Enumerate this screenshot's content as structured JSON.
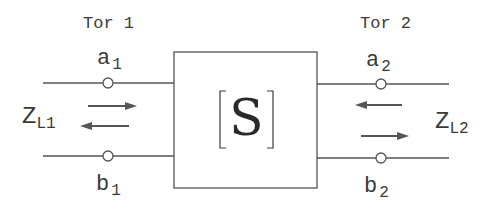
{
  "diagram": {
    "type": "two-port network",
    "ports": [
      {
        "name": "Tor 1",
        "incident_wave": {
          "base": "a",
          "sub": "1"
        },
        "reflected_wave": {
          "base": "b",
          "sub": "1"
        },
        "load": {
          "base": "Z",
          "sub": "L1"
        }
      },
      {
        "name": "Tor 2",
        "incident_wave": {
          "base": "a",
          "sub": "2"
        },
        "reflected_wave": {
          "base": "b",
          "sub": "2"
        },
        "load": {
          "base": "Z",
          "sub": "L2"
        }
      }
    ],
    "block": {
      "bracket_open": "[",
      "symbol": "S",
      "bracket_close": "]"
    },
    "colors": {
      "line": "#555555",
      "text": "#3a3a3a",
      "background": "#ffffff"
    }
  }
}
